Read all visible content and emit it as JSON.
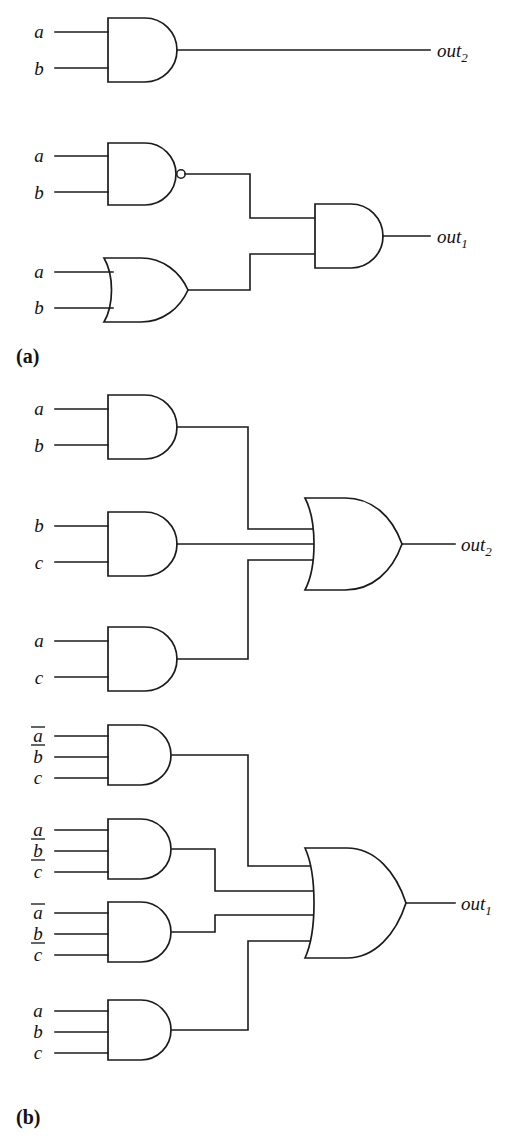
{
  "figure": {
    "background_color": "#ffffff",
    "line_color": "#1b1b1b",
    "text_color": "#121212",
    "panels": [
      {
        "key": "a",
        "label": "(a)"
      },
      {
        "key": "b",
        "label": "(b)"
      }
    ]
  },
  "panel_a": {
    "label": "(a)",
    "gates": [
      {
        "id": "a-and-1",
        "type": "AND",
        "inputs": [
          "a",
          "b"
        ],
        "output": "out2",
        "output_label": "out",
        "output_subscript": "2"
      },
      {
        "id": "a-nand-1",
        "type": "NAND",
        "inputs": [
          "a",
          "b"
        ],
        "output": "n1"
      },
      {
        "id": "a-or-1",
        "type": "OR",
        "inputs": [
          "a",
          "b"
        ],
        "output": "n2"
      },
      {
        "id": "a-and-2",
        "type": "AND",
        "inputs": [
          "n1",
          "n2"
        ],
        "output": "out1",
        "output_label": "out",
        "output_subscript": "1"
      }
    ],
    "input_labels": [
      {
        "id": "a-in-1",
        "text": "a",
        "bar": false
      },
      {
        "id": "a-in-2",
        "text": "b",
        "bar": false
      },
      {
        "id": "a-in-3",
        "text": "a",
        "bar": false
      },
      {
        "id": "a-in-4",
        "text": "b",
        "bar": false
      },
      {
        "id": "a-in-5",
        "text": "a",
        "bar": false
      },
      {
        "id": "a-in-6",
        "text": "b",
        "bar": false
      }
    ],
    "outputs": [
      {
        "id": "a-out-2",
        "label": "out",
        "subscript": "2"
      },
      {
        "id": "a-out-1",
        "label": "out",
        "subscript": "1"
      }
    ]
  },
  "panel_b": {
    "label": "(b)",
    "upper": {
      "output_label": "out",
      "output_subscript": "2",
      "and_gates": [
        {
          "id": "b-u-and-1",
          "inputs": [
            {
              "text": "a",
              "bar": false
            },
            {
              "text": "b",
              "bar": false
            }
          ]
        },
        {
          "id": "b-u-and-2",
          "inputs": [
            {
              "text": "b",
              "bar": false
            },
            {
              "text": "c",
              "bar": false
            }
          ]
        },
        {
          "id": "b-u-and-3",
          "inputs": [
            {
              "text": "a",
              "bar": false
            },
            {
              "text": "c",
              "bar": false
            }
          ]
        }
      ],
      "or_gate": {
        "id": "b-u-or",
        "type": "OR",
        "input_count": 3
      }
    },
    "lower": {
      "output_label": "out",
      "output_subscript": "1",
      "and_gates": [
        {
          "id": "b-l-and-1",
          "inputs": [
            {
              "text": "a",
              "bar": true
            },
            {
              "text": "b",
              "bar": true
            },
            {
              "text": "c",
              "bar": false
            }
          ]
        },
        {
          "id": "b-l-and-2",
          "inputs": [
            {
              "text": "a",
              "bar": false
            },
            {
              "text": "b",
              "bar": true
            },
            {
              "text": "c",
              "bar": true
            }
          ]
        },
        {
          "id": "b-l-and-3",
          "inputs": [
            {
              "text": "a",
              "bar": true
            },
            {
              "text": "b",
              "bar": false
            },
            {
              "text": "c",
              "bar": true
            }
          ]
        },
        {
          "id": "b-l-and-4",
          "inputs": [
            {
              "text": "a",
              "bar": false
            },
            {
              "text": "b",
              "bar": false
            },
            {
              "text": "c",
              "bar": false
            }
          ]
        }
      ],
      "or_gate": {
        "id": "b-l-or",
        "type": "OR",
        "input_count": 4
      }
    }
  }
}
